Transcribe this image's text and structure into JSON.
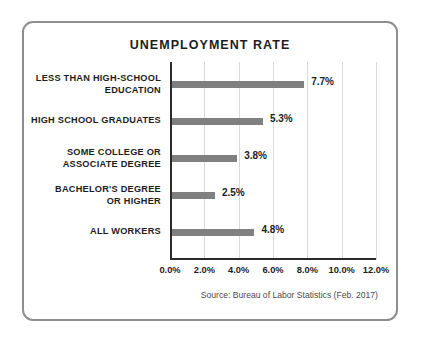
{
  "card": {
    "border_color": "#8e8e8e",
    "background": "#ffffff"
  },
  "source": {
    "text": "Source: Bureau of Labor Statistics (Feb. 2017)"
  },
  "chart_data": {
    "type": "bar",
    "orientation": "horizontal",
    "title": "UNEMPLOYMENT RATE",
    "xlabel": "",
    "ylabel": "",
    "xlim": [
      0,
      12
    ],
    "grid": true,
    "legend": "none",
    "bar_color": "#808080",
    "axis_color": "#2b2b2b",
    "gridline_color": "#d9d9d9",
    "tick_labels": [
      "0.0%",
      "2.0%",
      "4.0%",
      "6.0%",
      "8.0%",
      "10.0%",
      "12.0%"
    ],
    "tick_values": [
      0,
      2,
      4,
      6,
      8,
      10,
      12
    ],
    "categories": [
      "LESS THAN HIGH-SCHOOL EDUCATION",
      "HIGH SCHOOL GRADUATES",
      "SOME COLLEGE OR ASSOCIATE DEGREE",
      "BACHELOR'S DEGREE OR HIGHER",
      "ALL WORKERS"
    ],
    "values": [
      7.7,
      5.3,
      3.8,
      2.5,
      4.8
    ],
    "value_labels": [
      "7.7%",
      "5.3%",
      "3.8%",
      "2.5%",
      "4.8%"
    ],
    "bars": [
      {
        "label_line1": "LESS THAN HIGH-SCHOOL",
        "label_line2": "EDUCATION",
        "value": 7.7,
        "value_label": "7.7%"
      },
      {
        "label_line1": "HIGH SCHOOL GRADUATES",
        "label_line2": "",
        "value": 5.3,
        "value_label": "5.3%"
      },
      {
        "label_line1": "SOME COLLEGE OR",
        "label_line2": "ASSOCIATE DEGREE",
        "value": 3.8,
        "value_label": "3.8%"
      },
      {
        "label_line1": "BACHELOR'S DEGREE",
        "label_line2": "OR HIGHER",
        "value": 2.5,
        "value_label": "2.5%"
      },
      {
        "label_line1": "ALL WORKERS",
        "label_line2": "",
        "value": 4.8,
        "value_label": "4.8%"
      }
    ]
  }
}
